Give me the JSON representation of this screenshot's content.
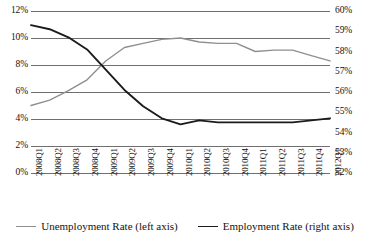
{
  "chart_data": {
    "type": "line",
    "title": "",
    "subtitle": "",
    "xlabel": "",
    "ylabel": "",
    "grid": true,
    "legend_position": "bottom",
    "categories": [
      "2008Q1",
      "2008Q2",
      "2008Q3",
      "2008Q4",
      "2009Q1",
      "2009Q2",
      "2009Q3",
      "2009Q4",
      "2010Q1",
      "2010Q2",
      "2010Q3",
      "2010Q4",
      "2011Q1",
      "2011Q2",
      "2011Q3",
      "2011Q4",
      "2012Q1"
    ],
    "axes": {
      "left": {
        "label": "Unemployment Rate (left axis)",
        "ylim": [
          0,
          12
        ],
        "ticks": [
          0,
          2,
          4,
          6,
          8,
          10,
          12
        ],
        "tick_labels": [
          "0%",
          "2%",
          "4%",
          "6%",
          "8%",
          "10%",
          "12%"
        ],
        "unit": "%"
      },
      "right": {
        "label": "Employment Rate (right axis)",
        "ylim": [
          52,
          60
        ],
        "ticks": [
          52,
          53,
          54,
          55,
          56,
          57,
          58,
          59,
          60
        ],
        "tick_labels": [
          "52%",
          "53%",
          "54%",
          "55%",
          "56%",
          "57%",
          "58%",
          "59%",
          "60%"
        ],
        "unit": "%"
      }
    },
    "series": [
      {
        "name": "Unemployment Rate (left axis)",
        "axis": "left",
        "color": "#8f8f8f",
        "width": 1.4,
        "values": [
          5.0,
          5.4,
          6.1,
          6.9,
          8.3,
          9.3,
          9.6,
          9.9,
          10.0,
          9.7,
          9.6,
          9.6,
          9.0,
          9.1,
          9.1,
          8.7,
          8.3
        ]
      },
      {
        "name": "Employment Rate (right axis)",
        "axis": "right",
        "color": "#1b1b1b",
        "width": 1.9,
        "values": [
          59.3,
          59.1,
          58.7,
          58.1,
          57.1,
          56.1,
          55.3,
          54.7,
          54.4,
          54.6,
          54.5,
          54.5,
          54.5,
          54.5,
          54.5,
          54.6,
          54.7
        ]
      }
    ]
  },
  "legend": {
    "items": [
      {
        "label": "Unemployment Rate (left axis)",
        "swatch": "line-gray"
      },
      {
        "label": "Employment Rate (right axis)",
        "swatch": "line-black"
      }
    ]
  },
  "colors": {
    "unemployment_line": "#8f8f8f",
    "employment_line": "#1b1b1b",
    "gridline": "#6f6f6f",
    "background": "#ffffff",
    "text": "#111111"
  }
}
